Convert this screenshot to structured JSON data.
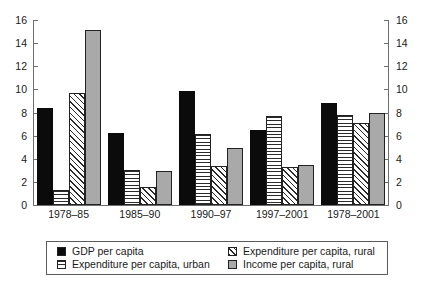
{
  "chart_data": {
    "type": "bar",
    "title": "",
    "subtitle": "",
    "xlabel": "",
    "ylabel": "",
    "ylim": [
      0,
      16
    ],
    "ytick_step": 2,
    "yticks": [
      0,
      2,
      4,
      6,
      8,
      10,
      12,
      14,
      16
    ],
    "ytick_labels": [
      "0",
      "2",
      "4",
      "6",
      "8",
      "10",
      "12",
      "14",
      "16"
    ],
    "dual_axis": true,
    "grid": false,
    "legend_position": "bottom",
    "categories": [
      "1978–85",
      "1985–90",
      "1990–97",
      "1997–2001",
      "1978–2001"
    ],
    "series": [
      {
        "name": "GDP per capita",
        "pattern": "solid-black",
        "color": "#0b0b0b",
        "values": [
          8.4,
          6.2,
          9.9,
          6.5,
          8.8
        ]
      },
      {
        "name": "Expenditure per capita, urban",
        "pattern": "horizontal-lines",
        "color": "#ffffff",
        "values": [
          1.3,
          3.05,
          6.15,
          7.7,
          7.75
        ]
      },
      {
        "name": "Expenditure per capita, rural",
        "pattern": "diagonal-hatch",
        "color": "#ffffff",
        "values": [
          9.7,
          1.55,
          3.4,
          3.3,
          7.1
        ]
      },
      {
        "name": "Income per capita, rural",
        "pattern": "solid-gray",
        "color": "#a9a9a9",
        "values": [
          15.1,
          2.95,
          4.95,
          3.5,
          8.0
        ]
      }
    ],
    "colors": {
      "axis": "#6d6d6d",
      "bar_outline": "#222222",
      "gray_fill": "#a9a9a9",
      "black_fill": "#0b0b0b",
      "background": "#ffffff"
    }
  },
  "legend": {
    "items": [
      {
        "label": "GDP per capita",
        "swatch": "solid-black-swatch"
      },
      {
        "label": "Expenditure per capita, rural",
        "swatch": "diagonal-hatch-swatch"
      },
      {
        "label": "Expenditure per capita, urban",
        "swatch": "horizontal-lines-swatch"
      },
      {
        "label": "Income per capita, rural",
        "swatch": "solid-gray-swatch"
      }
    ]
  }
}
